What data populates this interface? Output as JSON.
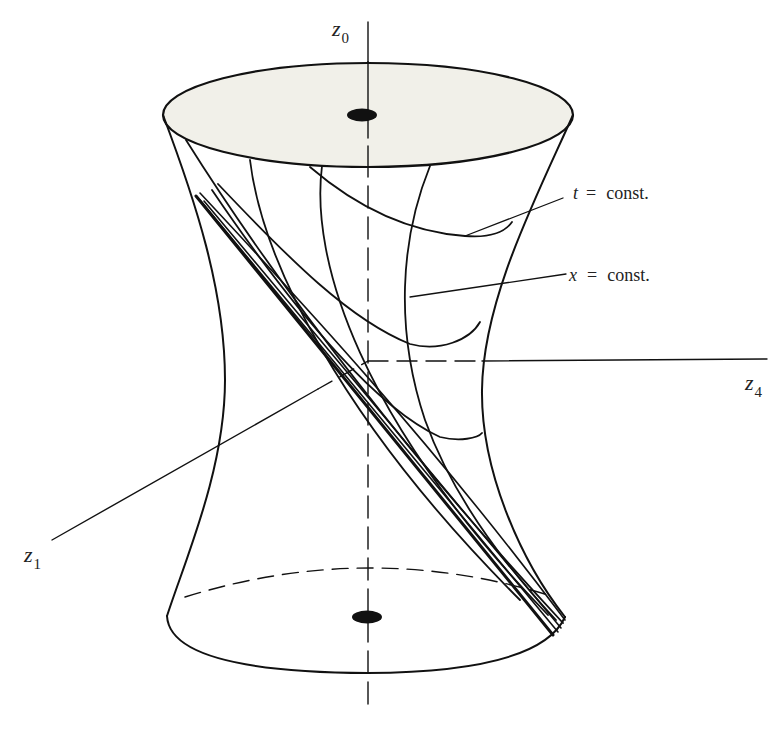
{
  "diagram": {
    "axes": {
      "z0": {
        "letter": "z",
        "subscript": "0"
      },
      "z4": {
        "letter": "z",
        "subscript": "4"
      },
      "z1": {
        "letter": "z",
        "subscript": "1"
      }
    },
    "annotations": {
      "t_const": {
        "var": "t",
        "eq": "=",
        "rest": "const."
      },
      "x_const": {
        "var": "x",
        "eq": "=",
        "rest": "const."
      }
    },
    "colors": {
      "stroke": "#111111",
      "top_disc_fill": "#f1f0e9",
      "background": "#ffffff"
    }
  }
}
